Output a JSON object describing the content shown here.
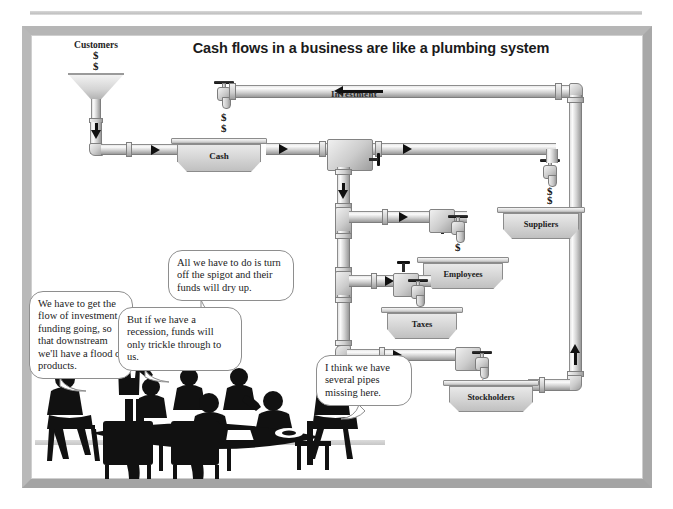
{
  "slide": {
    "title": "Cash flows in a business are like a plumbing system",
    "customers_label": "Customers",
    "investment_label": "Investment"
  },
  "tanks": [
    {
      "name": "cash",
      "label": "Cash"
    },
    {
      "name": "suppliers",
      "label": "Suppliers"
    },
    {
      "name": "employees",
      "label": "Employees"
    },
    {
      "name": "taxes",
      "label": "Taxes"
    },
    {
      "name": "stockholders",
      "label": "Stockholders"
    }
  ],
  "dollars": {
    "customers_1": "$",
    "customers_2": "$",
    "investment_drip_1": "$",
    "investment_drip_2": "$",
    "suppliers_drip_1": "$",
    "suppliers_drip_2": "$",
    "employees_drip": "$",
    "taxes_drip": "$",
    "stockholders_drip": "$"
  },
  "speech_bubbles": [
    {
      "name": "bubble-investment-flow",
      "text": "We have to get the flow of investment funding going, so that downstream we'll have a flood of products."
    },
    {
      "name": "bubble-spigot",
      "text": "All we have to do is turn off the spigot and their funds will dry up."
    },
    {
      "name": "bubble-recession",
      "text": "But if we have a recession, funds will only trickle through to us."
    },
    {
      "name": "bubble-missing-pipes",
      "text": "I think we have several pipes missing here."
    }
  ],
  "colors": {
    "frame": "#b0b0b0",
    "pipe_light": "#fbfbfb",
    "pipe_mid": "#d2d2d2",
    "pipe_dark": "#9a9a9a",
    "ink": "#101010",
    "tank_fill": "#d5d5d5"
  }
}
